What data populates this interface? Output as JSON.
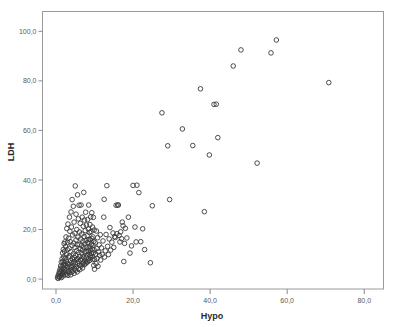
{
  "chart_data": {
    "type": "scatter",
    "title": "",
    "xlabel": "Hypo",
    "ylabel": "LDH",
    "xlim": [
      -3.5,
      85.0
    ],
    "ylim": [
      -4.0,
      108.0
    ],
    "grid": false,
    "legend": null,
    "x_ticks": [
      0,
      20,
      40,
      60,
      80
    ],
    "y_ticks": [
      0,
      20,
      40,
      60,
      80,
      100
    ],
    "x_tick_labels": [
      "0,0",
      "20,0",
      "40,0",
      "60,0",
      "80,0"
    ],
    "y_tick_labels": [
      "0,0",
      "20,0",
      "40,0",
      "60,0",
      "80,0",
      "100,0"
    ],
    "marker": {
      "shape": "open-circle",
      "radius": 2.3,
      "stroke": "#3a3a3a",
      "fill": "none"
    },
    "series": [
      {
        "name": "LDH vs Hypo",
        "points": [
          [
            0.4,
            0.5
          ],
          [
            0.5,
            1.2
          ],
          [
            0.6,
            0.3
          ],
          [
            0.7,
            2.1
          ],
          [
            0.8,
            1.0
          ],
          [
            0.9,
            3.2
          ],
          [
            1.0,
            0.8
          ],
          [
            1.0,
            2.4
          ],
          [
            1.1,
            4.1
          ],
          [
            1.2,
            1.6
          ],
          [
            1.2,
            5.3
          ],
          [
            1.3,
            2.9
          ],
          [
            1.4,
            0.6
          ],
          [
            1.4,
            6.8
          ],
          [
            1.5,
            3.7
          ],
          [
            1.5,
            1.9
          ],
          [
            1.6,
            8.2
          ],
          [
            1.6,
            5.0
          ],
          [
            1.7,
            2.2
          ],
          [
            1.7,
            10.5
          ],
          [
            1.8,
            4.4
          ],
          [
            1.8,
            7.1
          ],
          [
            1.9,
            1.3
          ],
          [
            1.9,
            12.0
          ],
          [
            2.0,
            3.0
          ],
          [
            2.0,
            5.9
          ],
          [
            2.0,
            9.0
          ],
          [
            2.1,
            14.3
          ],
          [
            2.1,
            2.6
          ],
          [
            2.2,
            6.5
          ],
          [
            2.2,
            11.2
          ],
          [
            2.3,
            4.0
          ],
          [
            2.3,
            15.0
          ],
          [
            2.4,
            8.4
          ],
          [
            2.4,
            1.8
          ],
          [
            2.5,
            13.1
          ],
          [
            2.5,
            5.5
          ],
          [
            2.6,
            17.0
          ],
          [
            2.6,
            3.4
          ],
          [
            2.7,
            9.8
          ],
          [
            2.7,
            7.0
          ],
          [
            2.8,
            20.4
          ],
          [
            2.8,
            2.0
          ],
          [
            2.9,
            11.9
          ],
          [
            2.9,
            6.2
          ],
          [
            3.0,
            4.6
          ],
          [
            3.0,
            14.8
          ],
          [
            3.1,
            1.5
          ],
          [
            3.1,
            22.2
          ],
          [
            3.2,
            8.9
          ],
          [
            3.2,
            3.1
          ],
          [
            3.3,
            16.5
          ],
          [
            3.3,
            6.0
          ],
          [
            3.4,
            12.4
          ],
          [
            3.4,
            2.5
          ],
          [
            3.5,
            25.0
          ],
          [
            3.5,
            9.3
          ],
          [
            3.6,
            5.1
          ],
          [
            3.6,
            19.3
          ],
          [
            3.7,
            3.9
          ],
          [
            3.7,
            15.1
          ],
          [
            3.8,
            7.4
          ],
          [
            3.8,
            1.7
          ],
          [
            3.9,
            27.1
          ],
          [
            3.9,
            11.0
          ],
          [
            4.0,
            4.8
          ],
          [
            4.0,
            21.0
          ],
          [
            4.1,
            6.7
          ],
          [
            4.1,
            2.8
          ],
          [
            4.2,
            32.1
          ],
          [
            4.2,
            13.6
          ],
          [
            4.3,
            8.0
          ],
          [
            4.3,
            17.8
          ],
          [
            4.4,
            5.4
          ],
          [
            4.4,
            3.3
          ],
          [
            4.5,
            29.4
          ],
          [
            4.5,
            10.2
          ],
          [
            4.6,
            6.9
          ],
          [
            4.6,
            14.5
          ],
          [
            4.7,
            2.3
          ],
          [
            4.7,
            23.0
          ],
          [
            4.8,
            8.7
          ],
          [
            4.8,
            4.3
          ],
          [
            4.9,
            18.5
          ],
          [
            4.9,
            12.7
          ],
          [
            5.0,
            6.1
          ],
          [
            5.0,
            37.6
          ],
          [
            5.1,
            9.5
          ],
          [
            5.1,
            3.6
          ],
          [
            5.2,
            15.8
          ],
          [
            5.2,
            26.2
          ],
          [
            5.3,
            7.8
          ],
          [
            5.3,
            5.0
          ],
          [
            5.4,
            20.0
          ],
          [
            5.4,
            11.5
          ],
          [
            5.5,
            13.9
          ],
          [
            5.5,
            2.9
          ],
          [
            5.6,
            34.0
          ],
          [
            5.6,
            8.3
          ],
          [
            5.7,
            6.4
          ],
          [
            5.7,
            16.9
          ],
          [
            5.8,
            4.2
          ],
          [
            5.8,
            24.3
          ],
          [
            5.9,
            10.8
          ],
          [
            5.9,
            7.2
          ],
          [
            6.0,
            29.8
          ],
          [
            6.0,
            14.0
          ],
          [
            6.1,
            5.6
          ],
          [
            6.1,
            19.0
          ],
          [
            6.2,
            9.1
          ],
          [
            6.2,
            3.8
          ],
          [
            6.3,
            12.2
          ],
          [
            6.3,
            22.5
          ],
          [
            6.4,
            7.6
          ],
          [
            6.4,
            16.1
          ],
          [
            6.5,
            5.3
          ],
          [
            6.5,
            29.9
          ],
          [
            6.6,
            10.4
          ],
          [
            6.6,
            13.5
          ],
          [
            6.7,
            8.1
          ],
          [
            6.7,
            18.2
          ],
          [
            6.8,
            6.0
          ],
          [
            6.8,
            25.0
          ],
          [
            6.9,
            11.7
          ],
          [
            6.9,
            4.5
          ],
          [
            7.0,
            15.3
          ],
          [
            7.0,
            9.0
          ],
          [
            7.1,
            21.3
          ],
          [
            7.1,
            6.6
          ],
          [
            7.2,
            12.9
          ],
          [
            7.2,
            35.0
          ],
          [
            7.3,
            8.5
          ],
          [
            7.3,
            17.2
          ],
          [
            7.4,
            5.8
          ],
          [
            7.4,
            23.8
          ],
          [
            7.5,
            10.9
          ],
          [
            7.5,
            14.2
          ],
          [
            7.6,
            7.3
          ],
          [
            7.6,
            19.6
          ],
          [
            7.7,
            6.3
          ],
          [
            7.7,
            27.0
          ],
          [
            7.8,
            11.1
          ],
          [
            7.8,
            15.5
          ],
          [
            7.9,
            8.8
          ],
          [
            7.9,
            21.8
          ],
          [
            8.0,
            6.8
          ],
          [
            8.0,
            13.0
          ],
          [
            8.1,
            17.5
          ],
          [
            8.1,
            9.7
          ],
          [
            8.2,
            24.0
          ],
          [
            8.2,
            7.0
          ],
          [
            8.3,
            14.7
          ],
          [
            8.3,
            11.3
          ],
          [
            8.4,
            20.2
          ],
          [
            8.4,
            8.2
          ],
          [
            8.5,
            29.9
          ],
          [
            8.5,
            16.0
          ],
          [
            8.6,
            10.0
          ],
          [
            8.6,
            12.5
          ],
          [
            8.7,
            18.8
          ],
          [
            8.7,
            7.5
          ],
          [
            8.8,
            22.0
          ],
          [
            8.8,
            13.3
          ],
          [
            8.9,
            9.4
          ],
          [
            8.9,
            15.9
          ],
          [
            9.0,
            11.6
          ],
          [
            9.0,
            25.1
          ],
          [
            9.1,
            8.6
          ],
          [
            9.1,
            19.2
          ],
          [
            9.2,
            14.1
          ],
          [
            9.2,
            10.3
          ],
          [
            9.3,
            26.8
          ],
          [
            9.3,
            16.4
          ],
          [
            9.4,
            12.1
          ],
          [
            9.4,
            9.2
          ],
          [
            9.5,
            21.0
          ],
          [
            9.5,
            7.9
          ],
          [
            9.6,
            17.0
          ],
          [
            9.6,
            13.7
          ],
          [
            9.7,
            10.6
          ],
          [
            9.7,
            24.9
          ],
          [
            9.8,
            15.2
          ],
          [
            9.8,
            5.5
          ],
          [
            9.9,
            19.8
          ],
          [
            9.9,
            11.8
          ],
          [
            10.0,
            8.0
          ],
          [
            10.0,
            4.0
          ],
          [
            10.2,
            14.6
          ],
          [
            10.3,
            10.1
          ],
          [
            10.4,
            6.2
          ],
          [
            10.5,
            19.4
          ],
          [
            10.6,
            12.3
          ],
          [
            10.7,
            8.4
          ],
          [
            10.8,
            16.7
          ],
          [
            10.9,
            5.2
          ],
          [
            11.0,
            11.0
          ],
          [
            11.2,
            13.8
          ],
          [
            11.3,
            9.6
          ],
          [
            11.5,
            17.9
          ],
          [
            11.6,
            7.7
          ],
          [
            11.8,
            12.6
          ],
          [
            12.0,
            10.0
          ],
          [
            12.2,
            15.4
          ],
          [
            12.4,
            25.0
          ],
          [
            12.5,
            32.2
          ],
          [
            12.6,
            8.9
          ],
          [
            12.8,
            11.4
          ],
          [
            13.0,
            18.0
          ],
          [
            13.2,
            37.7
          ],
          [
            13.4,
            13.2
          ],
          [
            13.6,
            9.9
          ],
          [
            13.8,
            16.2
          ],
          [
            14.0,
            20.8
          ],
          [
            14.2,
            11.7
          ],
          [
            14.5,
            14.9
          ],
          [
            14.8,
            18.6
          ],
          [
            15.0,
            12.8
          ],
          [
            15.2,
            17.1
          ],
          [
            15.4,
            16.8
          ],
          [
            15.6,
            29.8
          ],
          [
            15.8,
            18.3
          ],
          [
            16.0,
            29.9
          ],
          [
            16.2,
            29.9
          ],
          [
            16.4,
            17.6
          ],
          [
            16.6,
            15.0
          ],
          [
            16.8,
            19.1
          ],
          [
            17.0,
            16.3
          ],
          [
            17.2,
            23.0
          ],
          [
            17.4,
            21.5
          ],
          [
            17.6,
            7.1
          ],
          [
            17.8,
            14.4
          ],
          [
            18.0,
            20.5
          ],
          [
            18.4,
            16.6
          ],
          [
            18.8,
            25.0
          ],
          [
            19.2,
            10.5
          ],
          [
            19.6,
            13.4
          ],
          [
            20.0,
            37.8
          ],
          [
            20.5,
            21.0
          ],
          [
            20.8,
            15.0
          ],
          [
            21.0,
            37.9
          ],
          [
            21.5,
            34.9
          ],
          [
            22.0,
            15.1
          ],
          [
            22.5,
            20.3
          ],
          [
            23.0,
            11.9
          ],
          [
            24.5,
            6.6
          ],
          [
            25.0,
            29.6
          ],
          [
            27.5,
            67.1
          ],
          [
            29.0,
            53.8
          ],
          [
            29.5,
            32.1
          ],
          [
            32.8,
            60.6
          ],
          [
            35.5,
            53.9
          ],
          [
            37.5,
            76.8
          ],
          [
            38.5,
            27.2
          ],
          [
            39.8,
            50.1
          ],
          [
            41.0,
            70.5
          ],
          [
            41.6,
            70.6
          ],
          [
            42.0,
            57.1
          ],
          [
            46.0,
            86.0
          ],
          [
            48.0,
            92.5
          ],
          [
            52.2,
            46.8
          ],
          [
            55.8,
            91.3
          ],
          [
            57.2,
            96.5
          ],
          [
            70.8,
            79.3
          ]
        ]
      }
    ]
  }
}
